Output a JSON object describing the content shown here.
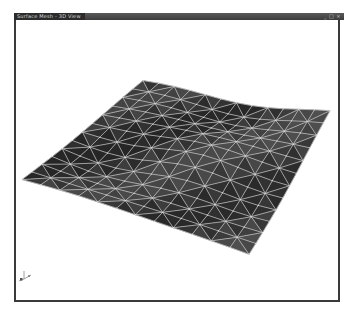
{
  "window": {
    "title": "Surface Mesh - 3D View",
    "controls": "_ □ ×"
  },
  "viewport": {
    "background": "#ffffff",
    "mesh": {
      "type": "triangulated-surface",
      "grid_rows": 12,
      "grid_cols": 12,
      "corners": {
        "top": [
          143,
          82
        ],
        "right": [
          330,
          113
        ],
        "bottom": [
          249,
          255
        ],
        "left": [
          22,
          180
        ]
      },
      "fill_color": "#3e3e3e",
      "edge_color": "#c8c8c8",
      "node_color": "#e0e0e0"
    },
    "axis_triad": {
      "label": "axis-orientation"
    }
  },
  "colors": {
    "titlebar": "#3c3c3c",
    "frame": "#3a3a3a"
  }
}
